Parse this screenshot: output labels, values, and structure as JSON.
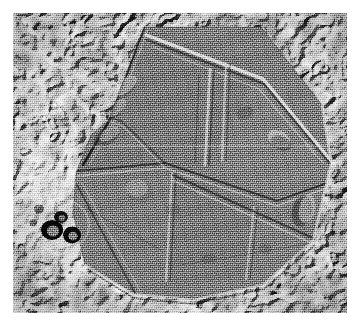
{
  "figure": {
    "kind": "electron-micrograph",
    "modality": "freeze-fracture / deep-etch transmission electron micrograph",
    "caption": "",
    "label": "",
    "scalebar_text": "",
    "canvas": {
      "width_px": 362,
      "height_px": 330,
      "background_hex": "#ffffff"
    },
    "image_area": {
      "left_px": 13,
      "top_px": 13,
      "width_px": 334,
      "height_px": 300
    },
    "palette": {
      "paper_hex": "#ffffff",
      "mid_gray_hex": "#8d8d8d",
      "plate_gray_hex": "#7f7f7f",
      "background_gray_hex": "#969696",
      "shadow_hex": "#2a2a2a",
      "highlight_hex": "#e8e8e8",
      "vesicle_hex": "#171717"
    },
    "content_description": "A large polygonal two-dimensional crystalline plate occupying the centre of the frame, subdivided by straight internal domain boundaries into several lattice domains; it is surrounded by a coarse dendritic etched background. Three dark rounded vesicles lie at the lower left.",
    "features": {
      "crystal_plate": {
        "name": "polygonal crystalline plate",
        "outline_points": "131,14 248,14 309,92 318,150 300,228 250,272 180,287 120,281 72,252 60,200 63,160 78,122 95,108",
        "fill_hex": "#7d7d7d",
        "domain_count": 6
      },
      "domain_boundaries": [
        {
          "name": "upper-left-diagonal-edge",
          "points": "131,14 95,108 72,150"
        },
        {
          "name": "upper-right-bright-ridge",
          "points": "133,20 250,64 318,146"
        },
        {
          "name": "mid-horizontal-seam",
          "points": "66,158 150,150 262,186 318,170"
        },
        {
          "name": "central-vertical-ridge",
          "points": "196,58 191,150"
        },
        {
          "name": "central-vertical-ridge-2",
          "points": "212,52 208,148"
        },
        {
          "name": "lower-left-diagonal",
          "points": "66,172 120,281"
        },
        {
          "name": "lower-inner-rectangle-left",
          "points": "158,162 152,268"
        },
        {
          "name": "lower-inner-rectangle-right",
          "points": "240,196 232,268"
        },
        {
          "name": "lower-right-diagonal",
          "points": "160,164 300,228"
        },
        {
          "name": "bottom-curved-edge",
          "points": "120,281 200,286 260,266 300,228"
        }
      ],
      "vesicles": [
        {
          "name": "vesicle-1",
          "cx": 39,
          "cy": 216,
          "r": 10
        },
        {
          "name": "vesicle-2",
          "cx": 58,
          "cy": 222,
          "r": 8
        },
        {
          "name": "vesicle-3",
          "cx": 49,
          "cy": 206,
          "r": 6
        }
      ],
      "blebs": [
        {
          "name": "bleb-upper-left",
          "cx": 108,
          "cy": 76,
          "rx": 16,
          "ry": 9,
          "rot": -35
        },
        {
          "name": "bleb-left-mid",
          "cx": 96,
          "cy": 126,
          "rx": 13,
          "ry": 8,
          "rot": -30
        },
        {
          "name": "bleb-centre-left",
          "cx": 128,
          "cy": 178,
          "rx": 12,
          "ry": 10,
          "rot": 10
        },
        {
          "name": "bleb-right",
          "cx": 266,
          "cy": 126,
          "rx": 12,
          "ry": 8,
          "rot": 25
        },
        {
          "name": "bleb-right-lower",
          "cx": 292,
          "cy": 200,
          "rx": 10,
          "ry": 14,
          "rot": 15
        }
      ]
    }
  }
}
